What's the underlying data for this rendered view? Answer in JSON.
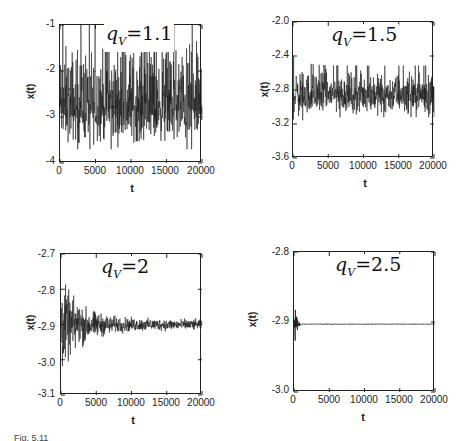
{
  "figure": {
    "caption_fragment": "Fig. 5.11",
    "x_axis_label": "t",
    "y_axis_label": "x(t)"
  },
  "panels": [
    {
      "id": "tl",
      "annotation": {
        "symbol": "q",
        "subscript": "V",
        "equals": "=",
        "value": "1.1"
      },
      "yticks": [
        "-1",
        "-2",
        "-3",
        "-4"
      ],
      "xticks": [
        "0",
        "5000",
        "10000",
        "15000",
        "20000"
      ],
      "xlabel": "t",
      "ylabel": "x(t)"
    },
    {
      "id": "tr",
      "annotation": {
        "symbol": "q",
        "subscript": "V",
        "equals": "=",
        "value": "1.5"
      },
      "yticks": [
        "-2.0",
        "-2.4",
        "-2.8",
        "-3.2",
        "-3.6"
      ],
      "xticks": [
        "0",
        "5000",
        "10000",
        "15000",
        "20000"
      ],
      "xlabel": "t",
      "ylabel": "x(t)"
    },
    {
      "id": "bl",
      "annotation": {
        "symbol": "q",
        "subscript": "V",
        "equals": "=",
        "value": "2"
      },
      "yticks": [
        "-2.7",
        "-2.8",
        "-2.9",
        "-3.0",
        "-3.1"
      ],
      "xticks": [
        "0",
        "5000",
        "10000",
        "15000",
        "20000"
      ],
      "xlabel": "t",
      "ylabel": "x(t)"
    },
    {
      "id": "br",
      "annotation": {
        "symbol": "q",
        "subscript": "V",
        "equals": "=",
        "value": "2.5"
      },
      "yticks": [
        "-2.8",
        "-2.9",
        "-3.0"
      ],
      "xticks": [
        "0",
        "5000",
        "10000",
        "15000",
        "20000"
      ],
      "xlabel": "t",
      "ylabel": "x(t)"
    }
  ],
  "chart_data": [
    {
      "type": "line",
      "title": "q_V = 1.1",
      "xlabel": "t",
      "ylabel": "x(t)",
      "xlim": [
        0,
        20000
      ],
      "ylim": [
        -4,
        -1
      ],
      "xticks": [
        0,
        5000,
        10000,
        15000,
        20000
      ],
      "yticks": [
        -1,
        -2,
        -3,
        -4
      ],
      "grid": false,
      "series": [
        {
          "name": "x(t)",
          "description": "noisy trace, mean ≈ -2.8, fluctuating roughly between -3.8 and -1.0 throughout; largest spikes near t<2000 and t≈8000",
          "mean": -2.8,
          "envelope_low": -3.8,
          "envelope_high": -1.0
        }
      ]
    },
    {
      "type": "line",
      "title": "q_V = 1.5",
      "xlabel": "t",
      "ylabel": "x(t)",
      "xlim": [
        0,
        20000
      ],
      "ylim": [
        -3.6,
        -2.0
      ],
      "xticks": [
        0,
        5000,
        10000,
        15000,
        20000
      ],
      "yticks": [
        -2.0,
        -2.4,
        -2.8,
        -3.2,
        -3.6
      ],
      "grid": false,
      "series": [
        {
          "name": "x(t)",
          "description": "noisy trace, mean ≈ -2.85, band roughly -3.2 to -2.4, initial spike near -2.1 at t≈0",
          "mean": -2.85,
          "envelope_low": -3.25,
          "envelope_high": -2.4
        }
      ]
    },
    {
      "type": "line",
      "title": "q_V = 2",
      "xlabel": "t",
      "ylabel": "x(t)",
      "xlim": [
        0,
        20000
      ],
      "ylim": [
        -3.1,
        -2.7
      ],
      "xticks": [
        0,
        5000,
        10000,
        15000,
        20000
      ],
      "yticks": [
        -2.7,
        -2.8,
        -2.9,
        -3.0,
        -3.1
      ],
      "grid": false,
      "series": [
        {
          "name": "x(t)",
          "description": "damped oscillation converging to ≈ -2.9; initial amplitude from -3.09 to -2.73, shrinking to ±0.02 by t=20000",
          "mean": -2.9,
          "envelope_low": -3.09,
          "envelope_high": -2.73
        }
      ]
    },
    {
      "type": "line",
      "title": "q_V = 2.5",
      "xlabel": "t",
      "ylabel": "x(t)",
      "xlim": [
        0,
        20000
      ],
      "ylim": [
        -3.0,
        -2.8
      ],
      "xticks": [
        0,
        5000,
        10000,
        15000,
        20000
      ],
      "yticks": [
        -2.8,
        -2.9,
        -3.0
      ],
      "grid": false,
      "series": [
        {
          "name": "x(t)",
          "description": "rapid transient in t<1000 (range ≈ -2.96 to -2.85) then flat at ≈ -2.903",
          "mean": -2.903,
          "envelope_low": -2.96,
          "envelope_high": -2.85
        }
      ]
    }
  ]
}
